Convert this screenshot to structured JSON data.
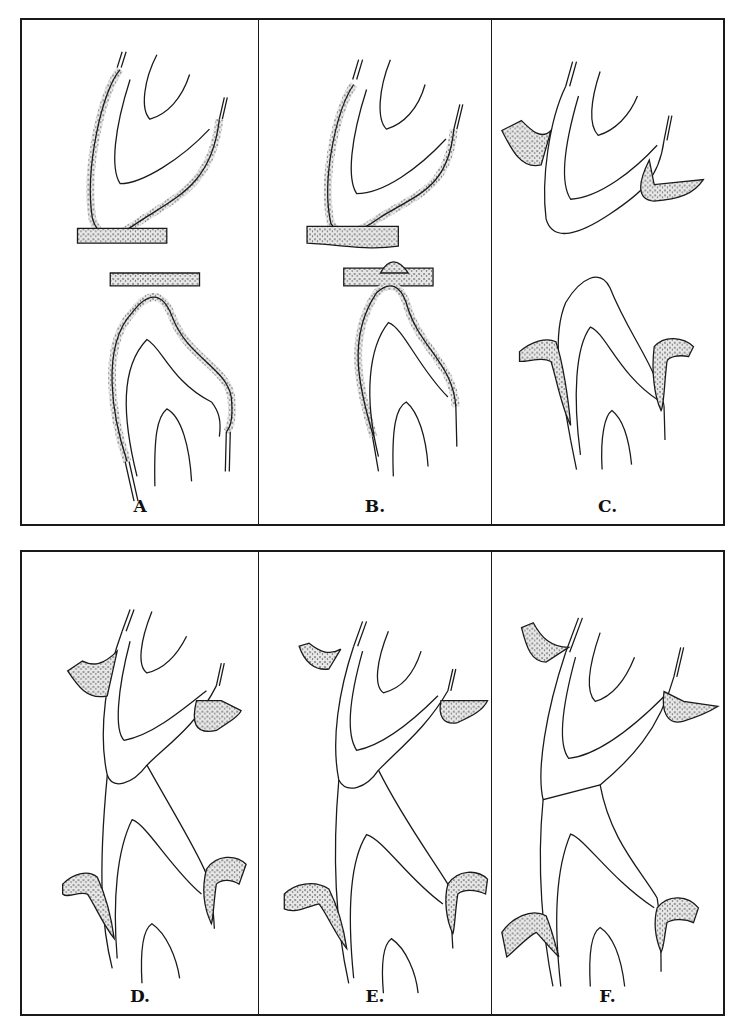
{
  "figure": {
    "rows": [
      {
        "panels": [
          {
            "label": "A",
            "stage": "teeth covered by reduced enamel epithelium, separate oral mucosa"
          },
          {
            "label": "B.",
            "stage": "reduced enamel epithelium fuses with oral epithelium"
          },
          {
            "label": "C.",
            "stage": "crowns emerge through mucosa"
          }
        ]
      },
      {
        "panels": [
          {
            "label": "D.",
            "stage": "teeth approach occlusion"
          },
          {
            "label": "E.",
            "stage": "teeth in contact"
          },
          {
            "label": "F.",
            "stage": "full occlusion with gingival attachment"
          }
        ]
      }
    ]
  },
  "colors": {
    "line": "#1a1a1a",
    "stipple": "#555555",
    "background": "#ffffff"
  }
}
